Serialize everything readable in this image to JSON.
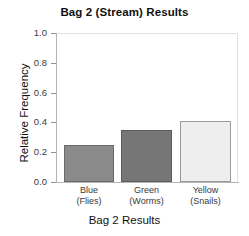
{
  "chart_data": {
    "type": "bar",
    "title": "Bag 2 (Stream) Results",
    "xlabel": "Bag 2 Results",
    "ylabel": "Relative Frequency",
    "categories": [
      "Blue\n(Flies)",
      "Green\n(Worms)",
      "Yellow\n(Snails)"
    ],
    "category_names": [
      "Blue",
      "Green",
      "Yellow"
    ],
    "category_sublabels": [
      "(Flies)",
      "(Worms)",
      "(Snails)"
    ],
    "values": [
      0.25,
      0.35,
      0.41
    ],
    "ylim": [
      0.0,
      1.0
    ],
    "ytick_labels": [
      "0.0",
      "0.2",
      "0.4",
      "0.6",
      "0.8",
      "1.0"
    ],
    "ytick_values": [
      0.0,
      0.2,
      0.4,
      0.6,
      0.8,
      1.0
    ],
    "grid": false,
    "legend": "none",
    "bar_colors": [
      "#8a8a8a",
      "#767676",
      "#eeeeee"
    ],
    "bar_edge_colors": [
      "#6a6a6a",
      "#5c5c5c",
      "#9a9a9a"
    ]
  },
  "axis": {
    "y_title": "Relative Frequency",
    "x_title": "Bag 2 Results"
  },
  "title": "Bag 2 (Stream) Results",
  "yticks": [
    {
      "label": "1.0",
      "value": 1.0
    },
    {
      "label": "0.8",
      "value": 0.8
    },
    {
      "label": "0.6",
      "value": 0.6
    },
    {
      "label": "0.4",
      "value": 0.4
    },
    {
      "label": "0.2",
      "value": 0.2
    },
    {
      "label": "0.0",
      "value": 0.0
    }
  ],
  "bars": [
    {
      "name": "Blue",
      "sub": "(Flies)",
      "value": 0.25,
      "fill": "#8a8a8a",
      "edge": "#6a6a6a"
    },
    {
      "name": "Green",
      "sub": "(Worms)",
      "value": 0.35,
      "fill": "#767676",
      "edge": "#5c5c5c"
    },
    {
      "name": "Yellow",
      "sub": "(Snails)",
      "value": 0.41,
      "fill": "#eeeeee",
      "edge": "#9a9a9a"
    }
  ]
}
